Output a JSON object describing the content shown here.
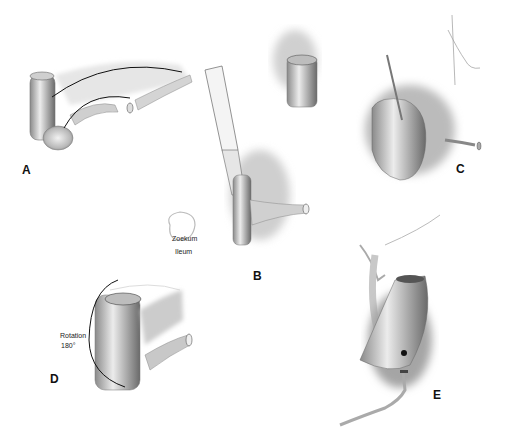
{
  "figure": {
    "panels": [
      {
        "id": "A",
        "label": "A"
      },
      {
        "id": "B",
        "label": "B"
      },
      {
        "id": "C",
        "label": "C"
      },
      {
        "id": "D",
        "label": "D"
      },
      {
        "id": "E",
        "label": "E"
      }
    ],
    "annotations": {
      "zoekum": "Zoekum",
      "ileum": "Ileum",
      "rotation_line1": "Rotation",
      "rotation_line2": "180°"
    },
    "colors": {
      "background": "#ffffff",
      "ink": "#111111",
      "shade_dark": "#555555",
      "shade_mid": "#9a9a9a",
      "shade_light": "#d8d8d8"
    }
  }
}
